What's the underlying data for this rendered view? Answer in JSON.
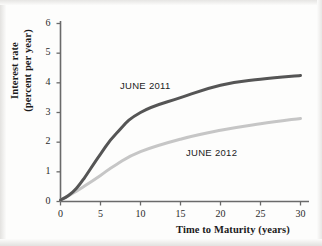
{
  "chart_data": {
    "type": "line",
    "title": "",
    "xlabel": "Time to Maturity (years)",
    "ylabel": "Interest rate (percent per year)",
    "ylabel_line1": "Interest rate",
    "ylabel_line2": "(percent per year)",
    "xlim": [
      0,
      31
    ],
    "ylim": [
      0,
      6
    ],
    "xticks": [
      0,
      5,
      10,
      15,
      20,
      25,
      30
    ],
    "xtick_labels": [
      "0",
      "5",
      "10",
      "15",
      "20",
      "25",
      "30"
    ],
    "yticks": [
      0,
      1,
      2,
      3,
      4,
      5,
      6
    ],
    "ytick_labels": [
      "0",
      "1",
      "2",
      "3",
      "4",
      "5",
      "6"
    ],
    "grid": false,
    "legend_position": "inline-annotations",
    "series": [
      {
        "name": "JUNE 2011",
        "color": "#555555",
        "annotation": "JUNE 2011",
        "x": [
          0,
          1,
          2,
          3,
          5,
          7,
          10,
          15,
          20,
          25,
          30
        ],
        "values": [
          0.05,
          0.2,
          0.45,
          0.8,
          1.6,
          2.3,
          3.0,
          3.5,
          3.92,
          4.12,
          4.25
        ]
      },
      {
        "name": "JUNE 2012",
        "color": "#c6c6c6",
        "annotation": "JUNE 2012",
        "x": [
          0,
          1,
          2,
          3,
          5,
          7,
          10,
          15,
          20,
          25,
          30
        ],
        "values": [
          0.05,
          0.2,
          0.35,
          0.52,
          0.88,
          1.25,
          1.68,
          2.1,
          2.4,
          2.62,
          2.8
        ]
      }
    ]
  },
  "axes": {
    "axis_color": "#6a6a6a",
    "tick_color": "#6a6a6a",
    "text_color": "#1b1b1b"
  }
}
